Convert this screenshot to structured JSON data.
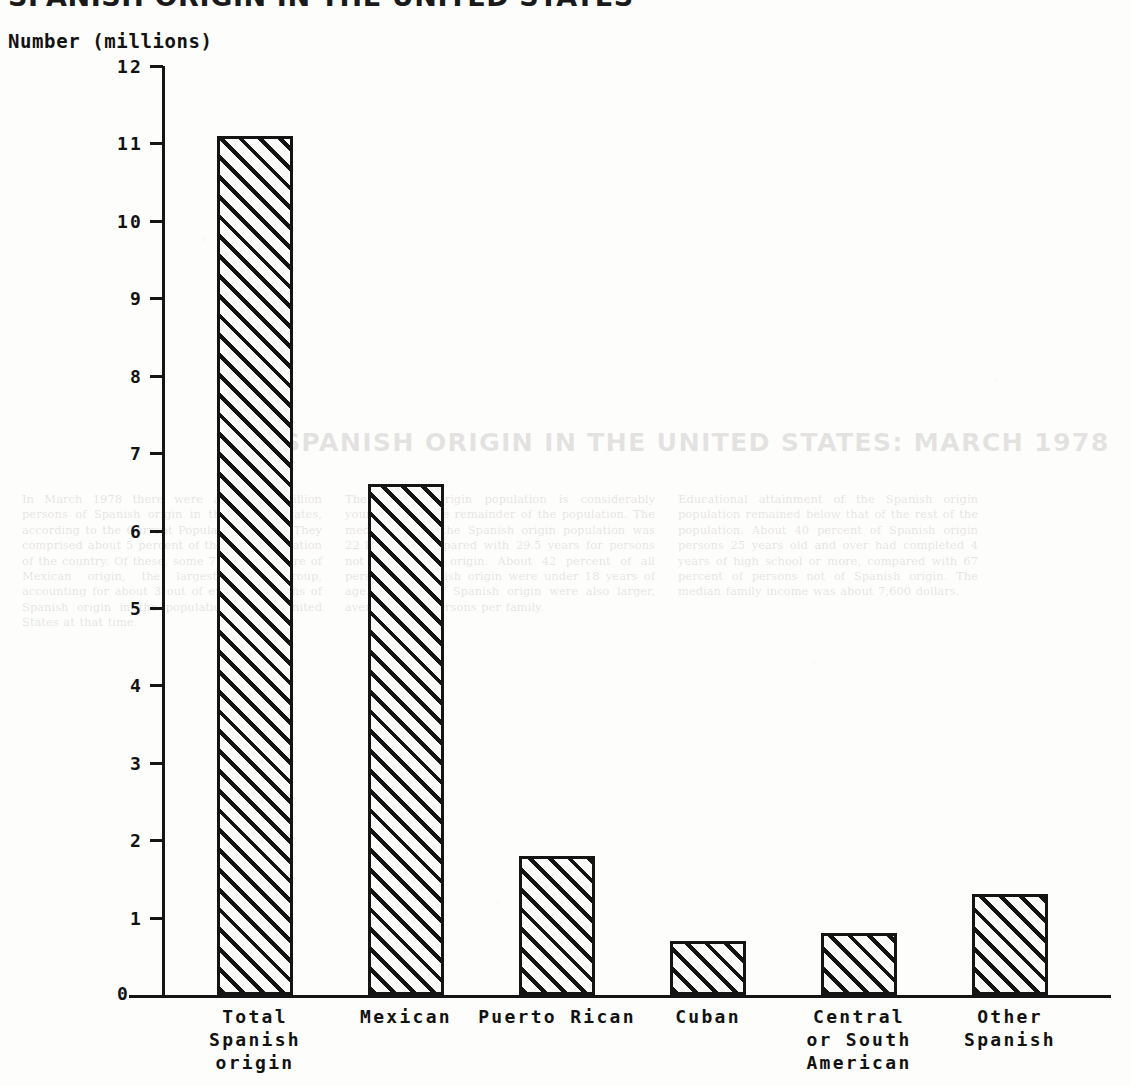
{
  "page": {
    "cut_off_title": "SPANISH ORIGIN IN THE UNITED STATES",
    "bleed_title": "SPANISH ORIGIN IN THE UNITED STATES: MARCH 1978",
    "bleed_col_1": "In March 1978 there were about 12 million persons of Spanish origin in the United States, according to the Current Population Survey. They comprised about 5 percent of the total population of the country. Of these, some 7.2 million were of Mexican origin, the largest single group, accounting for about 3 out of every 5 persons of Spanish origin in the population of the United States at that time.",
    "bleed_col_2": "The Spanish origin population is considerably younger than the remainder of the population. The median age of the Spanish origin population was 22.1 years, compared with 29.5 years for persons not of Spanish origin. About 42 percent of all persons of Spanish origin were under 18 years of age. Families of Spanish origin were also larger, averaging 3.9 persons per family.",
    "bleed_col_3": "Educational attainment of the Spanish origin population remained below that of the rest of the population. About 40 percent of Spanish origin persons 25 years old and over had completed 4 years of high school or more, compared with 67 percent of persons not of Spanish origin. The median family income was about 7,600 dollars."
  },
  "chart_data": {
    "type": "bar",
    "title": "",
    "xlabel": "",
    "ylabel": "Number (millions)",
    "ylim": [
      0,
      12
    ],
    "grid": false,
    "legend": "none",
    "y_ticks": [
      "0",
      "1",
      "2",
      "3",
      "4",
      "5",
      "6",
      "7",
      "8",
      "9",
      "10",
      "11",
      "12"
    ],
    "categories": [
      "Total\nSpanish\norigin",
      "Mexican",
      "Puerto Rican",
      "Cuban",
      "Central\nor South\nAmerican",
      "Other\nSpanish"
    ],
    "values": [
      11.1,
      6.6,
      1.8,
      0.7,
      0.8,
      1.3
    ],
    "colors": {
      "bar_fill": "#fbfbfa",
      "bar_hatch": "#141414",
      "axis": "#151515",
      "text": "#121212"
    }
  }
}
